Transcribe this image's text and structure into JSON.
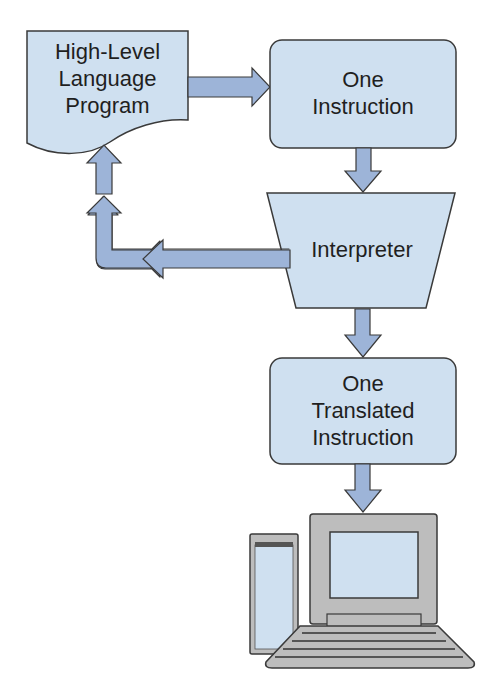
{
  "diagram": {
    "title": "",
    "nodes": [
      {
        "id": "hll-program",
        "shape": "document",
        "label_lines": [
          "High-Level",
          "Language",
          "Program"
        ]
      },
      {
        "id": "one-instruction",
        "shape": "rounded-rect",
        "label_lines": [
          "One",
          "Instruction"
        ]
      },
      {
        "id": "interpreter",
        "shape": "trapezoid",
        "label_lines": [
          "Interpreter"
        ]
      },
      {
        "id": "one-translated-instruction",
        "shape": "rounded-rect",
        "label_lines": [
          "One",
          "Translated",
          "Instruction"
        ]
      },
      {
        "id": "computer",
        "shape": "computer-icon",
        "label_lines": []
      }
    ],
    "edges": [
      {
        "from": "hll-program",
        "to": "one-instruction",
        "direction": "right"
      },
      {
        "from": "one-instruction",
        "to": "interpreter",
        "direction": "down"
      },
      {
        "from": "interpreter",
        "to": "hll-program",
        "direction": "left-then-up"
      },
      {
        "from": "interpreter",
        "to": "one-translated-instruction",
        "direction": "down"
      },
      {
        "from": "one-translated-instruction",
        "to": "computer",
        "direction": "down"
      }
    ],
    "colors": {
      "box_fill": "#cfe0f0",
      "arrow_fill": "#9db4d8",
      "stroke": "#3a3a3a",
      "computer_gray": "#bdbdbd",
      "text": "#1f1f1f"
    }
  },
  "labels": {
    "hll": {
      "l1": "High-Level",
      "l2": "Language",
      "l3": "Program"
    },
    "one_instruction": {
      "l1": "One",
      "l2": "Instruction"
    },
    "interpreter": {
      "l1": "Interpreter"
    },
    "translated": {
      "l1": "One",
      "l2": "Translated",
      "l3": "Instruction"
    }
  }
}
